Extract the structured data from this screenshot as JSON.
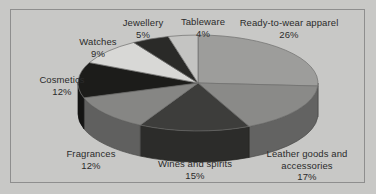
{
  "frame": {
    "border_color": "#8e8e8e",
    "background_color": "#c8c8c6"
  },
  "chart_data": {
    "type": "pie",
    "title": "",
    "subtitle": "",
    "xlabel": "",
    "ylabel": "",
    "legend_position": "none",
    "grid": false,
    "labels_show_percent": true,
    "total_percent": 100,
    "start_angle_deg": 0,
    "direction": "clockwise",
    "three_d": true,
    "categories": [
      "Ready-to-wear apparel",
      "Leather goods and accessories",
      "Wines and spirits",
      "Fragrances",
      "Cosmetics",
      "Watches",
      "Jewellery",
      "Tableware"
    ],
    "values": [
      26,
      17,
      15,
      12,
      12,
      9,
      5,
      4
    ],
    "value_labels": [
      "26%",
      "17%",
      "15%",
      "12%",
      "12%",
      "9%",
      "5%",
      "4%"
    ],
    "colors": [
      "#9d9d9b",
      "#8a8a88",
      "#3d3d3b",
      "#868684",
      "#1c1c1a",
      "#d8d8d6",
      "#2a2a28",
      "#c4c4c2"
    ],
    "slices": [
      {
        "label": "Ready-to-wear apparel",
        "value": 26,
        "value_label": "26%",
        "color": "#9d9d9b"
      },
      {
        "label": "Leather goods and accessories",
        "value": 17,
        "value_label": "17%",
        "color": "#8a8a88"
      },
      {
        "label": "Wines and spirits",
        "value": 15,
        "value_label": "15%",
        "color": "#3d3d3b"
      },
      {
        "label": "Fragrances",
        "value": 12,
        "value_label": "12%",
        "color": "#868684"
      },
      {
        "label": "Cosmetics",
        "value": 12,
        "value_label": "12%",
        "color": "#1c1c1a"
      },
      {
        "label": "Watches",
        "value": 9,
        "value_label": "9%",
        "color": "#d8d8d6"
      },
      {
        "label": "Jewellery",
        "value": 5,
        "value_label": "5%",
        "color": "#2a2a28"
      },
      {
        "label": "Tableware",
        "value": 4,
        "value_label": "4%",
        "color": "#c4c4c2"
      }
    ]
  },
  "labels": {
    "ready": {
      "name": "Ready-to-wear apparel",
      "pct": "26%"
    },
    "leather": {
      "name": "Leather goods and accessories",
      "pct": "17%"
    },
    "wines": {
      "name": "Wines and spirits",
      "pct": "15%"
    },
    "fragrances": {
      "name": "Fragrances",
      "pct": "12%"
    },
    "cosmetics": {
      "name": "Cosmetics",
      "pct": "12%"
    },
    "watches": {
      "name": "Watches",
      "pct": "9%"
    },
    "jewellery": {
      "name": "Jewellery",
      "pct": "5%"
    },
    "tableware": {
      "name": "Tableware",
      "pct": "4%"
    }
  }
}
